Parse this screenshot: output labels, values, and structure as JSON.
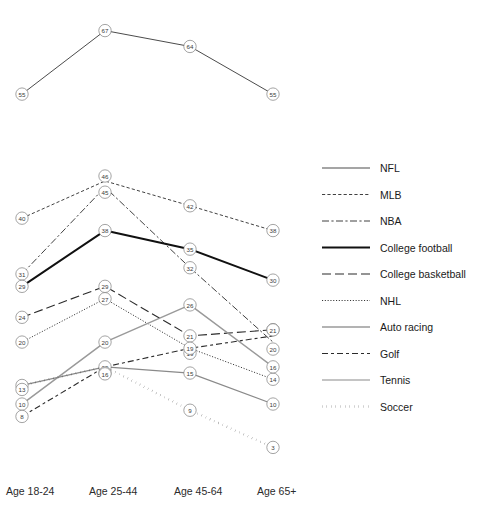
{
  "chart_data": {
    "type": "line",
    "title": "",
    "xlabel": "",
    "ylabel": "",
    "categories": [
      "Age 18-24",
      "Age 25-44",
      "Age 45-64",
      "Age 65+"
    ],
    "ylim": [
      0,
      70
    ],
    "grid": false,
    "legend_position": "right",
    "value_labels": true,
    "series": [
      {
        "name": "NFL",
        "values": [
          55,
          67,
          64,
          55
        ],
        "style": "solid-thin",
        "color": "#2b2b2b",
        "panel": "top"
      },
      {
        "name": "MLB",
        "values": [
          40,
          46,
          42,
          38
        ],
        "style": "dashed-fine",
        "color": "#2b2b2b",
        "panel": "bottom"
      },
      {
        "name": "NBA",
        "values": [
          31,
          45,
          32,
          20
        ],
        "style": "dash-dot",
        "color": "#2b2b2b",
        "panel": "bottom"
      },
      {
        "name": "College football",
        "values": [
          29,
          38,
          35,
          30
        ],
        "style": "solid-thick",
        "color": "#111111",
        "panel": "bottom"
      },
      {
        "name": "College basketball",
        "values": [
          24,
          29,
          21,
          22
        ],
        "style": "long-dash",
        "color": "#2b2b2b",
        "panel": "bottom"
      },
      {
        "name": "NHL",
        "values": [
          20,
          27,
          19,
          14
        ],
        "style": "dotted-fine",
        "color": "#2b2b2b",
        "panel": "bottom"
      },
      {
        "name": "Auto racing",
        "values": [
          10,
          20,
          26,
          16
        ],
        "style": "solid-gray",
        "color": "#9a9a9a",
        "panel": "bottom"
      },
      {
        "name": "Golf",
        "values": [
          8,
          16,
          19,
          21
        ],
        "style": "dash-dot-dash",
        "color": "#2b2b2b",
        "panel": "bottom"
      },
      {
        "name": "Tennis",
        "values": [
          13,
          16,
          15,
          10
        ],
        "style": "solid-medgray",
        "color": "#8a8a8a",
        "panel": "bottom"
      },
      {
        "name": "Soccer",
        "values": [
          13,
          16,
          9,
          3
        ],
        "style": "dotted-bold",
        "color": "#141414",
        "panel": "bottom"
      }
    ]
  },
  "legend": {
    "items": [
      {
        "label": "NFL"
      },
      {
        "label": "MLB"
      },
      {
        "label": "NBA"
      },
      {
        "label": "College football"
      },
      {
        "label": "College basketball"
      },
      {
        "label": "NHL"
      },
      {
        "label": "Auto racing"
      },
      {
        "label": "Golf"
      },
      {
        "label": "Tennis"
      },
      {
        "label": "Soccer"
      }
    ]
  },
  "axis": {
    "ticks": [
      "Age 18-24",
      "Age 25-44",
      "Age 45-64",
      "Age 65+"
    ]
  }
}
